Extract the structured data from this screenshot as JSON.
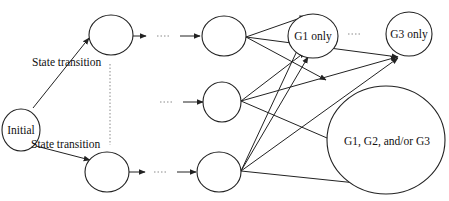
{
  "diagram": {
    "nodes": {
      "initial": {
        "label": "Initial"
      },
      "top_1": {
        "label": ""
      },
      "top_2": {
        "label": ""
      },
      "mid": {
        "label": ""
      },
      "bottom_1": {
        "label": ""
      },
      "bottom_2": {
        "label": ""
      },
      "g1_only": {
        "label": "G1 only"
      },
      "g3_only": {
        "label": "G3 only"
      },
      "g_any": {
        "label": "G1, G2, and/or G3"
      }
    },
    "edge_labels": {
      "upper": "State transition",
      "lower": "State transition"
    },
    "colors": {
      "stroke": "#222222",
      "dots": "#8a8a8a",
      "background": "#ffffff"
    }
  }
}
